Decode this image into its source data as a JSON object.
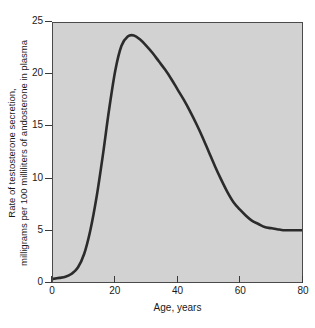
{
  "chart_data": {
    "type": "line",
    "title": "",
    "xlabel": "Age, years",
    "ylabel_line1": "Rate of testosterone secretion,",
    "ylabel_line2": "milligrams per 100 milliliters of andosterone in plasma",
    "xlim": [
      0,
      80
    ],
    "ylim": [
      0,
      25
    ],
    "xticks": [
      0,
      20,
      40,
      60,
      80
    ],
    "yticks": [
      0,
      5,
      10,
      15,
      20,
      25
    ],
    "xtick_labels": [
      "0",
      "20",
      "40",
      "60",
      "80"
    ],
    "ytick_labels": [
      "0",
      "5",
      "10",
      "15",
      "20",
      "25"
    ],
    "grid": false,
    "legend": "none",
    "plot_background_color": "#d2d2d2",
    "line_color": "#2b2b2b",
    "line_width": 2.6,
    "series": [
      {
        "name": "Rate of testosterone secretion",
        "x": [
          0,
          2,
          4,
          6,
          8,
          10,
          12,
          14,
          16,
          18,
          20,
          22,
          24,
          26,
          28,
          30,
          32,
          34,
          36,
          38,
          40,
          42,
          44,
          46,
          48,
          50,
          52,
          54,
          56,
          58,
          60,
          62,
          64,
          66,
          68,
          70,
          72,
          74,
          76,
          78,
          80
        ],
        "values": [
          0.3,
          0.4,
          0.5,
          0.8,
          1.4,
          2.7,
          5.0,
          8.2,
          12.2,
          16.6,
          20.4,
          22.8,
          23.7,
          23.8,
          23.4,
          22.8,
          22.1,
          21.3,
          20.5,
          19.6,
          18.6,
          17.6,
          16.5,
          15.3,
          14.0,
          12.6,
          11.2,
          9.9,
          8.7,
          7.7,
          7.0,
          6.4,
          5.9,
          5.6,
          5.3,
          5.2,
          5.1,
          5.0,
          5.0,
          5.0,
          5.0
        ]
      }
    ],
    "annotations": {
      "peak_age": 26,
      "peak_value": 23.8,
      "plateau_value": 5.0
    }
  }
}
